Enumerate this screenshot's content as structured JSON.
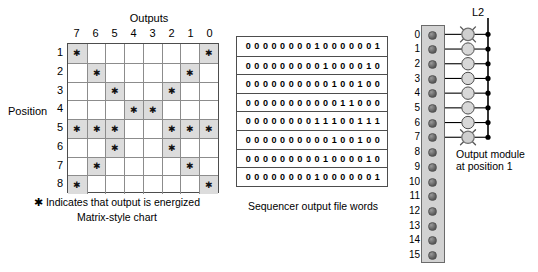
{
  "matrix": {
    "outputs_title": "Outputs",
    "position_label": "Position",
    "column_headers": [
      "7",
      "6",
      "5",
      "4",
      "3",
      "2",
      "1",
      "0"
    ],
    "row_headers": [
      "1",
      "2",
      "3",
      "4",
      "5",
      "6",
      "7",
      "8"
    ],
    "legend": "✱ Indicates that output is energized",
    "caption": "Matrix-style chart",
    "star_glyph": "✱",
    "rows": [
      [
        1,
        0,
        0,
        0,
        0,
        0,
        0,
        1
      ],
      [
        0,
        1,
        0,
        0,
        0,
        0,
        1,
        0
      ],
      [
        0,
        0,
        1,
        0,
        0,
        1,
        0,
        0
      ],
      [
        0,
        0,
        0,
        1,
        1,
        0,
        0,
        0
      ],
      [
        1,
        1,
        1,
        0,
        0,
        1,
        1,
        1
      ],
      [
        0,
        0,
        1,
        0,
        0,
        1,
        0,
        0
      ],
      [
        0,
        1,
        0,
        0,
        0,
        0,
        1,
        0
      ],
      [
        1,
        0,
        0,
        0,
        0,
        0,
        0,
        1
      ]
    ]
  },
  "sequencer": {
    "caption": "Sequencer output file words",
    "words": [
      "0 0 0 0 0 0 0 0 1 0 0 0 0 0 0 1",
      "0 0 0 0 0 0 0 0 0 1 0 0 0 0 1 0",
      "0 0 0 0 0 0 0 0 0 0 1 0 0 1 0 0",
      "0 0 0 0 0 0 0 0 0 0 0 1 1 0 0 0",
      "0 0 0 0 0 0 0 0 1 1 1 0 0 1 1 1",
      "0 0 0 0 0 0 0 0 0 0 1 0 0 1 0 0",
      "0 0 0 0 0 0 0 0 0 1 0 0 0 0 1 0",
      "0 0 0 0 0 0 0 0 1 0 0 0 0 0 0 1"
    ]
  },
  "module": {
    "bus_label": "L2",
    "caption_line1": "Output module",
    "caption_line2": "at position 1",
    "terminals": [
      {
        "number": "0",
        "has_lamp": true,
        "energized": true
      },
      {
        "number": "1",
        "has_lamp": true,
        "energized": false
      },
      {
        "number": "2",
        "has_lamp": true,
        "energized": false
      },
      {
        "number": "3",
        "has_lamp": true,
        "energized": false
      },
      {
        "number": "4",
        "has_lamp": true,
        "energized": false
      },
      {
        "number": "5",
        "has_lamp": true,
        "energized": false
      },
      {
        "number": "6",
        "has_lamp": true,
        "energized": false
      },
      {
        "number": "7",
        "has_lamp": true,
        "energized": true
      },
      {
        "number": "8",
        "has_lamp": false,
        "energized": false
      },
      {
        "number": "9",
        "has_lamp": false,
        "energized": false
      },
      {
        "number": "10",
        "has_lamp": false,
        "energized": false
      },
      {
        "number": "11",
        "has_lamp": false,
        "energized": false
      },
      {
        "number": "12",
        "has_lamp": false,
        "energized": false
      },
      {
        "number": "13",
        "has_lamp": false,
        "energized": false
      },
      {
        "number": "14",
        "has_lamp": false,
        "energized": false
      },
      {
        "number": "15",
        "has_lamp": false,
        "energized": false
      }
    ]
  },
  "colors": {
    "cell_on": "#dcdcdc",
    "grid_line": "#8c8c8c",
    "grid_border": "#4d4d4d",
    "module_body": "#d2d2d2",
    "lamp_fill": "#d4d4d4",
    "wire": "#000000"
  }
}
